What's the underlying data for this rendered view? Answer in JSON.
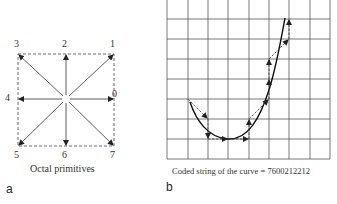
{
  "panel_a": {
    "label": "a",
    "caption": "Octal primitives",
    "directions": [
      {
        "code": "0",
        "angle_deg": 0
      },
      {
        "code": "1",
        "angle_deg": 45
      },
      {
        "code": "2",
        "angle_deg": 90
      },
      {
        "code": "3",
        "angle_deg": 135
      },
      {
        "code": "4",
        "angle_deg": 180
      },
      {
        "code": "5",
        "angle_deg": 225
      },
      {
        "code": "6",
        "angle_deg": 270
      },
      {
        "code": "7",
        "angle_deg": 315
      }
    ]
  },
  "panel_b": {
    "label": "b",
    "caption": "Coded string of the curve = 7600212212",
    "code_string": "7600212212",
    "grid": {
      "columns": 8,
      "rows": 8
    }
  }
}
